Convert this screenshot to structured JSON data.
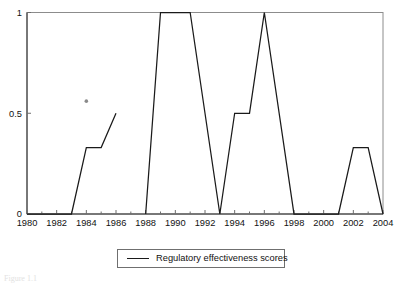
{
  "figure": {
    "caption": "Figure 1.1",
    "background_color": "#ffffff",
    "line_color": "#1a1a1a",
    "frame_color": "#8c8c8c"
  },
  "legend": {
    "label": "Regulatory effectiveness scores",
    "marker": "line-swatch",
    "position": "below-axes-center"
  },
  "chart_data": {
    "type": "line",
    "title": "",
    "xlabel": "",
    "ylabel": "",
    "xlim": [
      1980,
      2004
    ],
    "ylim": [
      0,
      1
    ],
    "grid": false,
    "legend_position": "bottom",
    "xticks": [
      1980,
      1982,
      1984,
      1986,
      1988,
      1990,
      1992,
      1994,
      1996,
      1998,
      2000,
      2002,
      2004
    ],
    "xtick_labels": [
      "1980",
      "1982",
      "1984",
      "1986",
      "1988",
      "1990",
      "1992",
      "1994",
      "1996",
      "1998",
      "2000",
      "2002",
      "2004"
    ],
    "xticks_minor": [
      1981,
      1983,
      1985,
      1987,
      1989,
      1991,
      1993,
      1995,
      1997,
      1999,
      2001,
      2003
    ],
    "yticks": [
      0,
      0.5,
      1
    ],
    "ytick_labels": [
      "0",
      "0.5",
      "1"
    ],
    "series": [
      {
        "name": "Regulatory effectiveness scores",
        "x": [
          1980,
          1981,
          1982,
          1983,
          1984,
          1985,
          1986
        ],
        "values": [
          0,
          0,
          0,
          0,
          0.33,
          0.33,
          0.5
        ]
      },
      {
        "name": "Regulatory effectiveness scores",
        "x": [
          1988,
          1989,
          1990,
          1991,
          1993,
          1994,
          1995,
          1996,
          1998,
          1999,
          2000,
          2001,
          2002,
          2003,
          2004
        ],
        "values": [
          0,
          1,
          1,
          1,
          0,
          0.5,
          0.5,
          1,
          0,
          0,
          0,
          0,
          0.33,
          0.33,
          0
        ]
      }
    ],
    "annotations": [
      {
        "name": "stray-dot",
        "x": 1984,
        "y": 0.56
      }
    ]
  }
}
